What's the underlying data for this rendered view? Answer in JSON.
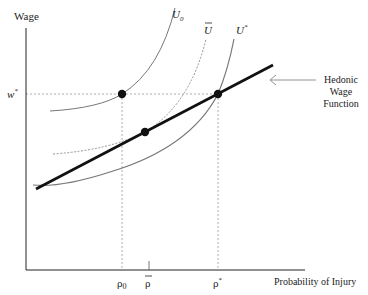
{
  "axes": {
    "y_label": "Wage",
    "x_label": "Probability of Injury"
  },
  "ticks": {
    "w_star": "w",
    "w_star_sup": "*",
    "rho_0": "ρ",
    "rho_0_sub": "0",
    "rho_bar": "ρ",
    "rho_star": "ρ",
    "rho_star_sup": "*"
  },
  "curves": {
    "u0_label": "U",
    "u0_sub": "0",
    "ubar_label": "U",
    "ustar_label": "U",
    "ustar_sup": "*"
  },
  "annotation": {
    "line1": "Hedonic",
    "line2": "Wage",
    "line3": "Function"
  },
  "colors": {
    "axis": "#222222",
    "curve": "#777777",
    "hedonic": "#111111",
    "guide": "#999999"
  }
}
